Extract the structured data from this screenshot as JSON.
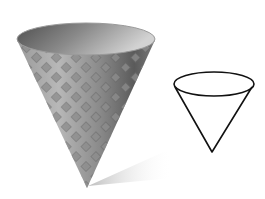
{
  "scene": {
    "description": "Shaded 3D waffle cone beside a simple line drawing of a cone",
    "colors": {
      "background": "#ffffff",
      "cone_light": "#b4b4b4",
      "cone_mid": "#8c8c8c",
      "cone_dark": "#4a4a4a",
      "interior_dark": "#5a5a5a",
      "interior_light": "#c8c8c8",
      "shadow": "#d0d0d0",
      "line": "#111111"
    },
    "objects": [
      {
        "name": "waffle-cone",
        "type": "shaded-3d"
      },
      {
        "name": "cone-outline",
        "type": "line-drawing"
      }
    ]
  }
}
